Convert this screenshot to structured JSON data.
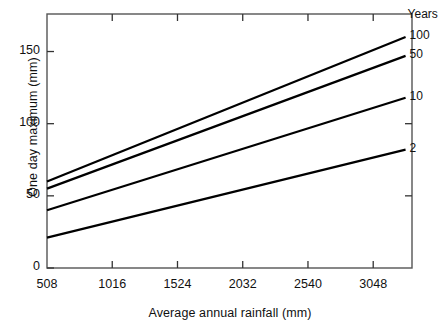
{
  "chart_data": {
    "type": "line",
    "title": "",
    "xlabel": "Average annual rainfall (mm)",
    "ylabel": "One day maximum (mm)",
    "xlim": [
      508,
      3350
    ],
    "ylim": [
      0,
      176
    ],
    "grid": false,
    "legend_position": "right-of-lines",
    "legend_title": "Years",
    "xticks": [
      508,
      1016,
      1524,
      2032,
      2540,
      3048
    ],
    "xtick_labels": [
      "508",
      "1016",
      "1524",
      "2032",
      "2540",
      "3048"
    ],
    "yticks": [
      0,
      50,
      100,
      150
    ],
    "ytick_labels": [
      "0",
      "50",
      "100",
      "150"
    ],
    "series": [
      {
        "name": "100",
        "label": "100",
        "x": [
          508,
          3300
        ],
        "values": [
          60,
          160
        ]
      },
      {
        "name": "50",
        "label": "50",
        "x": [
          508,
          3300
        ],
        "values": [
          55,
          147
        ]
      },
      {
        "name": "10",
        "label": "10",
        "x": [
          508,
          3300
        ],
        "values": [
          40,
          118
        ]
      },
      {
        "name": "2",
        "label": "2",
        "x": [
          508,
          3300
        ],
        "values": [
          21,
          82
        ]
      }
    ],
    "line_color": "#000000",
    "axis_color": "#555555"
  }
}
